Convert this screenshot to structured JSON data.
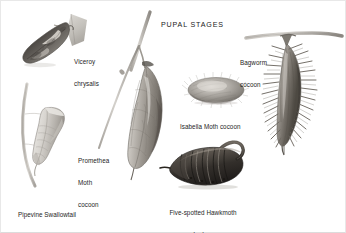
{
  "plate": {
    "title": "PUPAL STAGES",
    "background_color": "#ffffff",
    "ink_color": "#1d1d1d",
    "frame_color": "#e8e8e8",
    "width": 346,
    "height": 233
  },
  "specimens": [
    {
      "id": "viceroy",
      "label": "Viceroy\nchrysalis",
      "label_lines": [
        "Viceroy",
        "chrysalis"
      ],
      "icon": "viceroy-chrysalis-icon",
      "description": "dark mottled chrysalis attached to a leaf",
      "tone_dark": "#5d5a56",
      "tone_mid": "#8d8a85",
      "tone_light": "#c9c6c1"
    },
    {
      "id": "pipevine",
      "label": "Pipevine Swallowtail\nchrysalis",
      "label_lines": [
        "Pipevine Swallowtail",
        "chrysalis"
      ],
      "icon": "pipevine-swallowtail-chrysalis-icon",
      "description": "pale angular chrysalis girdled to a curved stem",
      "tone_dark": "#9a968f",
      "tone_mid": "#c2bfb9",
      "tone_light": "#e3e1dd"
    },
    {
      "id": "promethea",
      "label": "Promethea\nMoth\ncocoon",
      "label_lines": [
        "Promethea",
        "Moth",
        "cocoon"
      ],
      "icon": "promethea-moth-cocoon-icon",
      "description": "elongate leaf-wrapped cocoon hanging from a twig",
      "tone_dark": "#6e6a64",
      "tone_mid": "#a5a199",
      "tone_light": "#d2cfc9"
    },
    {
      "id": "isabella",
      "label": "Isabella Moth cocoon",
      "label_lines": [
        "Isabella Moth cocoon"
      ],
      "icon": "isabella-moth-cocoon-icon",
      "description": "fuzzy hairy oval cocoon",
      "tone_dark": "#6f6c67",
      "tone_mid": "#9d9a95",
      "tone_light": "#cdcac5"
    },
    {
      "id": "hawkmoth",
      "label": "Five-spotted Hawkmoth\nnaked pupa",
      "label_lines": [
        "Five-spotted Hawkmoth",
        "naked pupa"
      ],
      "icon": "five-spotted-hawkmoth-pupa-icon",
      "description": "dark segmented naked pupa with jug-handle proboscis sheath",
      "tone_dark": "#2f2c29",
      "tone_mid": "#57524c",
      "tone_light": "#8e8880"
    },
    {
      "id": "bagworm",
      "label": "Bagworm\ncocoon",
      "label_lines": [
        "Bagworm",
        "cocoon"
      ],
      "icon": "bagworm-cocoon-icon",
      "description": "shaggy spindle-shaped bag of needles hanging from a branch",
      "tone_dark": "#5b5753",
      "tone_mid": "#8b8782",
      "tone_light": "#bcb8b2"
    }
  ]
}
